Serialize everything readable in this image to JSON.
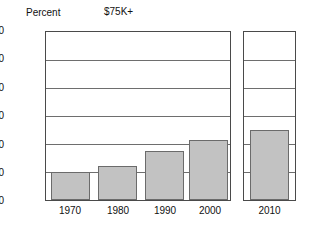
{
  "chart_data": {
    "type": "bar",
    "title": "$75K+",
    "ylabel": "Percent",
    "xlabel": "",
    "categories": [
      "1970",
      "1980",
      "1990",
      "2000",
      "2010"
    ],
    "values": [
      10,
      12,
      17.5,
      21.5,
      25
    ],
    "ylim": [
      0,
      60
    ],
    "yticks": [
      0,
      10,
      20,
      30,
      40,
      50,
      60
    ],
    "ytick_labels": [
      "0",
      "10",
      "20",
      "30",
      "40",
      "50",
      "60"
    ],
    "grid": true,
    "legend": "none",
    "series": [
      {
        "name": "$75K+",
        "values": [
          10,
          12,
          17.5,
          21.5,
          25
        ]
      }
    ],
    "panels": [
      {
        "name": "historical",
        "categories": [
          "1970",
          "1980",
          "1990",
          "2000"
        ],
        "values": [
          10,
          12,
          17.5,
          21.5
        ]
      },
      {
        "name": "projection",
        "categories": [
          "2010"
        ],
        "values": [
          25
        ]
      }
    ],
    "colors": {
      "bar_fill": "#c2c2c2",
      "bar_stroke": "#6b6b6b",
      "gridline": "#6e6e6e",
      "axis": "#4a4a4a",
      "text": "#111111",
      "background": "#ffffff"
    }
  }
}
